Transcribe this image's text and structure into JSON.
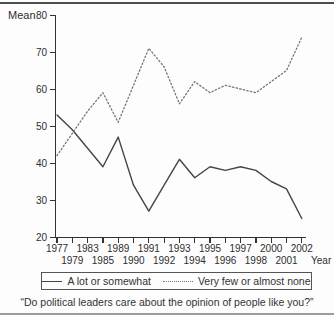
{
  "chart_data": {
    "type": "line",
    "title": "",
    "ylabel": "Mean",
    "xlabel": "Year",
    "ylim": [
      20,
      80
    ],
    "yticks": [
      20,
      30,
      40,
      50,
      60,
      70,
      80
    ],
    "grid": false,
    "legend_position": "bottom-box",
    "categories": [
      "1977",
      "1979",
      "1983",
      "1985",
      "1989",
      "1990",
      "1991",
      "1992",
      "1993",
      "1994",
      "1995",
      "1996",
      "1997",
      "1998",
      "2000",
      "2001",
      "2002"
    ],
    "x_tick_label_layout": "staggered-two-rows",
    "series": [
      {
        "name": "A lot or somewhat",
        "style": "solid",
        "color": "#454545",
        "values": [
          53,
          49,
          44,
          39,
          47,
          34,
          27,
          34,
          41,
          36,
          39,
          38,
          39,
          38,
          35,
          33,
          25
        ]
      },
      {
        "name": "Very few or almost none",
        "style": "dotted",
        "color": "#757575",
        "values": [
          42,
          48,
          54,
          59,
          51,
          61,
          71,
          66,
          56,
          62,
          59,
          61,
          60,
          59,
          62,
          65,
          74
        ]
      }
    ]
  },
  "caption": "“Do political leaders care about the opinion of people like you?”"
}
